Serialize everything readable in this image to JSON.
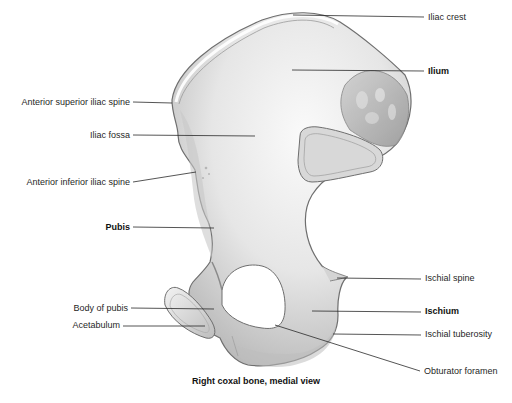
{
  "figure": {
    "caption": "Right coxal bone, medial view",
    "labels": {
      "iliac_crest": "Iliac crest",
      "ilium": "Ilium",
      "anterior_superior_iliac_spine": "Anterior superior iliac spine",
      "iliac_fossa": "Iliac fossa",
      "anterior_inferior_iliac_spine": "Anterior inferior iliac spine",
      "pubis": "Pubis",
      "ischial_spine": "Ischial spine",
      "ischium": "Ischium",
      "body_of_pubis": "Body of pubis",
      "acetabulum": "Acetabulum",
      "ischial_tuberosity": "Ischial tuberosity",
      "obturator_foramen": "Obturator foramen"
    },
    "colors": {
      "bone_fill": "#e4e4e4",
      "bone_outline": "#6e6e6e",
      "leader_line": "#2a2a2a",
      "background": "#ffffff"
    }
  }
}
